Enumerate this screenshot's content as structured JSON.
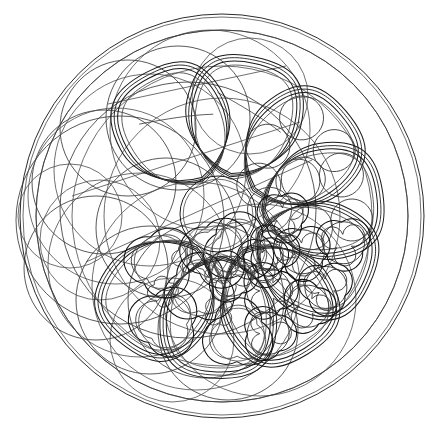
{
  "drawing": {
    "title": "Gothic rose window tracery construction",
    "subject": "rose-window",
    "medium": "line drawing",
    "background_color": "#ffffff",
    "line_color": "#1a1a1a",
    "construction_line_color": "#3a3a3a",
    "canvas": {
      "width": 448,
      "height": 434
    }
  },
  "geometry": {
    "outer_circle": {
      "cx": 222,
      "cy": 216,
      "r": 202,
      "label": "outer rim circle"
    },
    "inner_ring": {
      "cx": 222,
      "cy": 216,
      "r": 186,
      "label": "inner guide circle"
    },
    "oculus": {
      "cx": 218,
      "cy": 214,
      "r": 38,
      "label": "central oculus"
    },
    "petal_count": 8,
    "petal_ring_radius": 118,
    "elaboration_note": "petals progress from bare construction circles at left to fully cusped foliated tracery at right and lower right"
  },
  "petals": [
    {
      "index": 0,
      "name": "petal-north",
      "angle_deg": -78,
      "fill": "plain",
      "detail": "empty pear lobe, plain outline"
    },
    {
      "index": 1,
      "name": "petal-north-northeast",
      "angle_deg": -40,
      "fill": "circles",
      "detail": "five packed circles"
    },
    {
      "index": 2,
      "name": "petal-east-northeast",
      "angle_deg": -8,
      "fill": "circles",
      "detail": "five packed circles"
    },
    {
      "index": 3,
      "name": "petal-east",
      "angle_deg": 24,
      "fill": "trefoils",
      "detail": "circles with trefoil cusping"
    },
    {
      "index": 4,
      "name": "petal-east-southeast",
      "angle_deg": 58,
      "fill": "trefoils",
      "detail": "circles with trefoil cusping"
    },
    {
      "index": 5,
      "name": "petal-southeast",
      "angle_deg": 92,
      "fill": "foliated",
      "detail": "heavy cusped foliation"
    },
    {
      "index": 6,
      "name": "petal-south",
      "angle_deg": 128,
      "fill": "foliated",
      "detail": "heavy cusped foliation"
    },
    {
      "index": 7,
      "name": "petal-northwest",
      "angle_deg": -118,
      "fill": "plain",
      "detail": "empty pear lobe, plain outline"
    }
  ],
  "construction_circles": [
    {
      "cx": 104,
      "cy": 182,
      "r": 72
    },
    {
      "cx": 96,
      "cy": 268,
      "r": 72
    },
    {
      "cx": 150,
      "cy": 300,
      "r": 74
    },
    {
      "cx": 166,
      "cy": 228,
      "r": 70
    },
    {
      "cx": 206,
      "cy": 300,
      "r": 78
    },
    {
      "cx": 128,
      "cy": 128,
      "r": 68
    },
    {
      "cx": 178,
      "cy": 118,
      "r": 72
    },
    {
      "cx": 228,
      "cy": 330,
      "r": 70
    },
    {
      "cx": 120,
      "cy": 220,
      "r": 104
    },
    {
      "cx": 188,
      "cy": 210,
      "r": 128
    }
  ],
  "labels": {
    "none_visible": "this drawing contains no text, numbers, axes or captions"
  }
}
